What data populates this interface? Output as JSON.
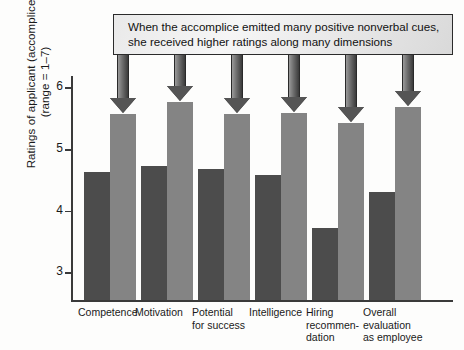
{
  "chart_data": {
    "type": "bar",
    "title": "",
    "xlabel": "",
    "ylabel": "Ratings of applicant (accomplice)",
    "ylabel_line2": "(range = 1–7)",
    "ylim": [
      2.55,
      6.15
    ],
    "yticks": [
      3,
      4,
      5,
      6
    ],
    "ytick_labels": [
      "3",
      "4",
      "5",
      "6"
    ],
    "grid": false,
    "legend": "none",
    "categories": [
      "Competence",
      "Motivation",
      "Potential\nfor success",
      "Intelligence",
      "Hiring\nrecommen-\ndation",
      "Overall\nevaluation\nas employee"
    ],
    "category_lines": [
      [
        "Competence"
      ],
      [
        "Motivation"
      ],
      [
        "Potential",
        "for success"
      ],
      [
        "Intelligence"
      ],
      [
        "Hiring",
        "recommen-",
        "dation"
      ],
      [
        "Overall",
        "evaluation",
        "as employee"
      ]
    ],
    "series": [
      {
        "name": "Few positive nonverbal cues",
        "color": "#4c4c4c",
        "values": [
          4.62,
          4.72,
          4.68,
          4.57,
          3.72,
          4.3
        ]
      },
      {
        "name": "Many positive nonverbal cues",
        "color": "#848484",
        "values": [
          5.57,
          5.76,
          5.56,
          5.58,
          5.42,
          5.68
        ]
      }
    ],
    "annotations": [
      {
        "text_line1": "When the accomplice emitted many positive nonverbal cues,",
        "text_line2": "she received higher ratings along many dimensions",
        "points_to_series": "Many positive nonverbal cues",
        "arrow_count": 6
      }
    ]
  },
  "axis": {
    "tick_3": "3",
    "tick_4": "4",
    "tick_5": "5",
    "tick_6": "6"
  },
  "callout": {
    "line1": "When the accomplice emitted many positive nonverbal cues,",
    "line2": "she received higher ratings along many dimensions"
  },
  "colors": {
    "bar_dark": "#4c4c4c",
    "bar_light": "#848484",
    "axis": "#3a3a3a",
    "callout_border": "#2b2b2b",
    "arrow": "#555555",
    "background": "#fdfdfc"
  }
}
